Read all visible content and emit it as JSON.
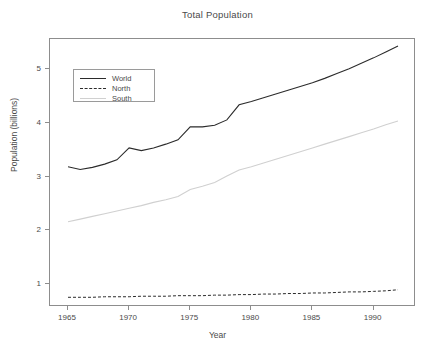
{
  "chart_data": {
    "type": "line",
    "title": "Total Population",
    "xlabel": "Year",
    "ylabel": "Population (billions)",
    "xlim": [
      1965,
      1992
    ],
    "ylim": [
      0.58,
      5.55
    ],
    "grid": false,
    "legend_position": "top-left",
    "xticks": [
      1965,
      1970,
      1975,
      1980,
      1985,
      1990
    ],
    "xtick_labels": [
      "1965",
      "1970",
      "1975",
      "1980",
      "1985",
      "1990"
    ],
    "yticks": [
      1,
      2,
      3,
      4,
      5
    ],
    "ytick_labels": [
      "1",
      "2",
      "3",
      "4",
      "5"
    ],
    "x": [
      1965,
      1966,
      1967,
      1968,
      1969,
      1970,
      1971,
      1972,
      1973,
      1974,
      1975,
      1976,
      1977,
      1978,
      1979,
      1980,
      1981,
      1982,
      1983,
      1984,
      1985,
      1986,
      1987,
      1988,
      1989,
      1990,
      1991,
      1992
    ],
    "series": [
      {
        "name": "World",
        "color": "#2b2b2b",
        "style": "solid",
        "values": [
          3.18,
          3.13,
          3.17,
          3.23,
          3.31,
          3.53,
          3.48,
          3.53,
          3.6,
          3.68,
          3.92,
          3.92,
          3.95,
          4.05,
          4.33,
          4.39,
          4.46,
          4.53,
          4.6,
          4.67,
          4.74,
          4.82,
          4.91,
          5.0,
          5.1,
          5.2,
          5.31,
          5.42
        ]
      },
      {
        "name": "North",
        "color": "#2b2b2b",
        "style": "dashed",
        "values": [
          0.76,
          0.76,
          0.76,
          0.77,
          0.77,
          0.77,
          0.78,
          0.78,
          0.78,
          0.79,
          0.79,
          0.79,
          0.8,
          0.8,
          0.81,
          0.81,
          0.82,
          0.82,
          0.83,
          0.83,
          0.84,
          0.84,
          0.85,
          0.86,
          0.86,
          0.87,
          0.88,
          0.9
        ]
      },
      {
        "name": "South",
        "color": "#d0d0d0",
        "style": "solid",
        "values": [
          2.16,
          2.21,
          2.26,
          2.31,
          2.36,
          2.41,
          2.46,
          2.52,
          2.57,
          2.63,
          2.76,
          2.82,
          2.89,
          3.01,
          3.12,
          3.18,
          3.25,
          3.32,
          3.39,
          3.46,
          3.53,
          3.6,
          3.67,
          3.74,
          3.81,
          3.88,
          3.96,
          4.03
        ]
      }
    ]
  },
  "legend": {
    "entries": [
      {
        "label": "World"
      },
      {
        "label": "North"
      },
      {
        "label": "South"
      }
    ]
  }
}
